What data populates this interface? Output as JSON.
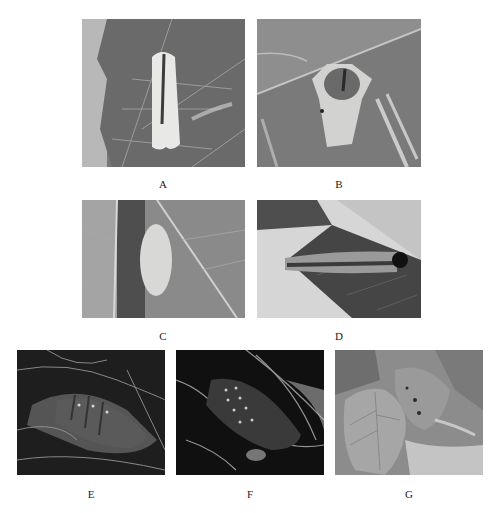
{
  "figure": {
    "panels": [
      {
        "id": "A",
        "label": "A",
        "subject": "adult moth resting on leaf (wings folded, white)"
      },
      {
        "id": "B",
        "label": "B",
        "subject": "adult moth on leaf underside, dorsal view"
      },
      {
        "id": "C",
        "label": "C",
        "subject": "egg mass beside leaf midrib"
      },
      {
        "id": "D",
        "label": "D",
        "subject": "larva (caterpillar) on leaf with dark head capsule"
      },
      {
        "id": "E",
        "label": "E",
        "subject": "pupa inside silk cocoon, lateral view"
      },
      {
        "id": "F",
        "label": "F",
        "subject": "pupa inside silk cocoon, dorsal view with spots"
      },
      {
        "id": "G",
        "label": "G",
        "subject": "damaged leaves and shoots with webbing"
      }
    ]
  }
}
